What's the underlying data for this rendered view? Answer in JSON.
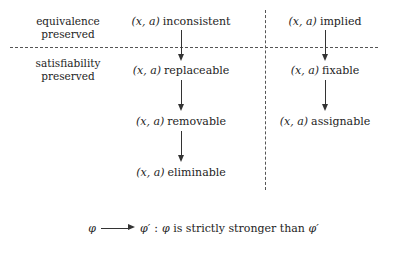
{
  "figure": {
    "regions": [
      {
        "id": "equivalence",
        "line1": "equivalence",
        "line2": "preserved"
      },
      {
        "id": "satisfiability",
        "line1": "satisfiability",
        "line2": "preserved"
      }
    ],
    "pair": {
      "open": "(",
      "x": "x",
      "comma": ",",
      "a": "a",
      "close": ")"
    },
    "columns": [
      {
        "id": "left-column",
        "nodes": [
          {
            "pair": "(x, a)",
            "word": "inconsistent"
          },
          {
            "pair": "(x, a)",
            "word": "replaceable"
          },
          {
            "pair": "(x, a)",
            "word": "removable"
          },
          {
            "pair": "(x, a)",
            "word": "eliminable"
          }
        ]
      },
      {
        "id": "right-column",
        "nodes": [
          {
            "pair": "(x, a)",
            "word": "implied"
          },
          {
            "pair": "(x, a)",
            "word": "fixable"
          },
          {
            "pair": "(x, a)",
            "word": "assignable"
          }
        ]
      }
    ],
    "legend": {
      "phi": "φ",
      "phi_prime": "φ′",
      "separator": ":",
      "text_before": "",
      "text_middle": "is strictly stronger than"
    },
    "colors": {
      "background": "#ffffff",
      "text": "#1d1d1d",
      "rule": "#555555",
      "arrow": "#333333"
    }
  }
}
